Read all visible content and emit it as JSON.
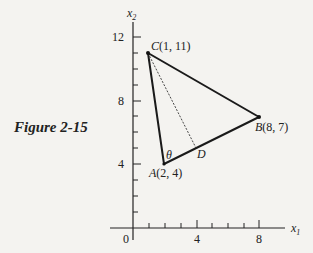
{
  "caption": "Figure 2-15",
  "axes": {
    "x_label": "x",
    "x_sub": "1",
    "y_label": "x",
    "y_sub": "2",
    "origin_label": "0",
    "x_ticks": [
      "4",
      "8"
    ],
    "y_ticks": [
      "4",
      "8",
      "12"
    ]
  },
  "points": {
    "A": {
      "label": "A(2, 4)",
      "x": 2,
      "y": 4
    },
    "B": {
      "label": "B(8, 7)",
      "x": 8,
      "y": 7
    },
    "C": {
      "label": "C(1, 11)",
      "x": 1,
      "y": 11
    },
    "D": {
      "label": "D"
    }
  },
  "angle_label": "θ",
  "colors": {
    "line": "#1a1a1a",
    "background": "#f4f3f0"
  }
}
